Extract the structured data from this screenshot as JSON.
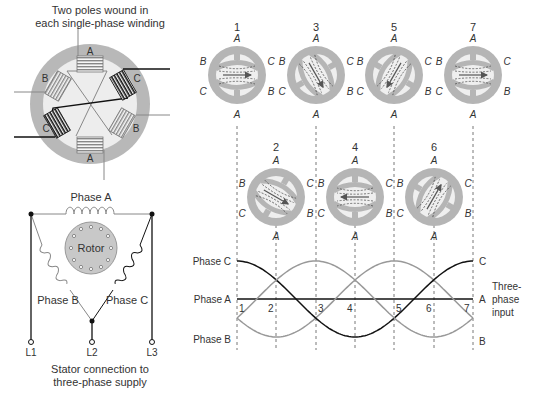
{
  "stator_diagram": {
    "caption_line1": "Two poles wound in",
    "caption_line2": "each single-phase winding",
    "pole_labels": [
      "A",
      "C",
      "B",
      "A",
      "C",
      "B"
    ],
    "colors": {
      "ring": "#b5b5b5",
      "ring_inner": "#ececec",
      "black_winding": "#111111",
      "gray_winding": "#8a8a8a"
    }
  },
  "delta_circuit": {
    "phase_a_label": "Phase A",
    "phase_b_label": "Phase B",
    "phase_c_label": "Phase C",
    "rotor_label": "Rotor",
    "terminals": [
      "L1",
      "L2",
      "L3"
    ],
    "caption_line1": "Stator connection to",
    "caption_line2": "three-phase supply"
  },
  "field_positions": {
    "top_row": [
      {
        "step": "1"
      },
      {
        "step": "3"
      },
      {
        "step": "5"
      },
      {
        "step": "7"
      }
    ],
    "bottom_row": [
      {
        "step": "2"
      },
      {
        "step": "4"
      },
      {
        "step": "6"
      }
    ],
    "axis_labels": {
      "top": "A",
      "bottom": "A",
      "left_upper": "B",
      "left_lower": "C",
      "right_upper": "C",
      "right_lower": "B"
    },
    "pole_letters": {
      "north": "N",
      "south": "S",
      "off": "O"
    }
  },
  "waveforms": {
    "left_labels": [
      "Phase C",
      "Phase A",
      "Phase B"
    ],
    "right_labels": [
      "C",
      "A",
      "B"
    ],
    "x_ticks": [
      "1",
      "2",
      "3",
      "4",
      "5",
      "6",
      "7"
    ],
    "side_note_line1": "Three-",
    "side_note_line2": "phase",
    "side_note_line3": "input",
    "colors": {
      "phase_a": "#111111",
      "phase_b": "#999999",
      "phase_c": "#111111"
    }
  },
  "footer": {
    "figure_label": "Figure 24-1"
  }
}
